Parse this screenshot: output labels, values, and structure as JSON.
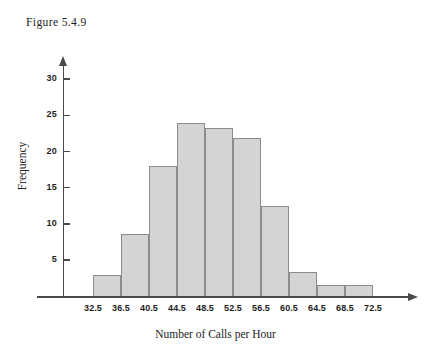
{
  "figure": {
    "label": "Figure 5.4.9"
  },
  "chart_data": {
    "type": "bar",
    "title": "Figure 5.4.9",
    "xlabel": "Number of Calls per Hour",
    "ylabel": "Frequency",
    "categories": [
      "32.5-36.5",
      "36.5-40.5",
      "40.5-44.5",
      "44.5-48.5",
      "48.5-52.5",
      "52.5-56.5",
      "56.5-60.5",
      "60.5-64.5",
      "64.5-68.5",
      "68.5-72.5"
    ],
    "bin_edges": [
      32.5,
      36.5,
      40.5,
      44.5,
      48.5,
      52.5,
      56.5,
      60.5,
      64.5,
      68.5,
      72.5
    ],
    "values": [
      3,
      8.6,
      18,
      24,
      23.3,
      21.9,
      12.5,
      3.4,
      1.5,
      1.5
    ],
    "xtick_labels": [
      "32.5",
      "36.5",
      "40.5",
      "44.5",
      "48.5",
      "52.5",
      "56.5",
      "60.5",
      "64.5",
      "68.5",
      "72.5"
    ],
    "ytick_labels": [
      "5",
      "10",
      "15",
      "20",
      "25",
      "30"
    ],
    "ytick_values": [
      5,
      10,
      15,
      20,
      25,
      30
    ],
    "ylim": [
      0,
      33
    ],
    "xlim": [
      32.5,
      72.5
    ],
    "grid": false,
    "legend": false,
    "bar_fill_color": "#d4d4d4",
    "bar_border_color": "#8c8c8c",
    "axis_color": "#4a4a4a"
  }
}
